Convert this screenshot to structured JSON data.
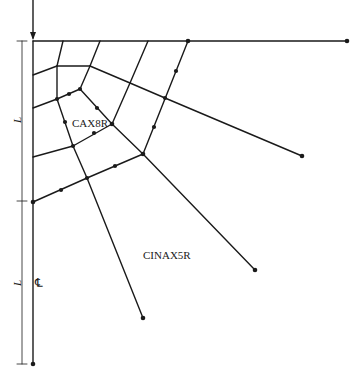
{
  "diagram": {
    "type": "finite-element-mesh",
    "line_color": "#1a1a1a",
    "background": "#ffffff",
    "labels": {
      "inner_element": "CAX8R",
      "outer_element": "CINAX5R",
      "dimension_upper": "L",
      "dimension_lower": "L",
      "centerline": "C̲L"
    },
    "centerline_symbol": "℄"
  }
}
